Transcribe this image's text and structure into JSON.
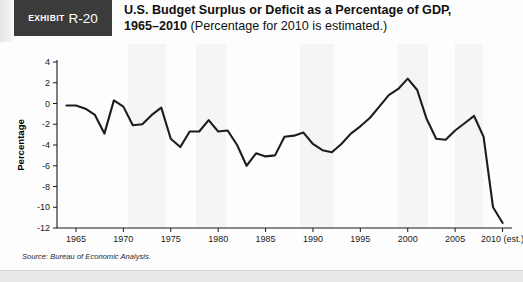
{
  "header": {
    "exhibit_word": "Exhibit",
    "exhibit_number": "R-20",
    "title_line1_bold": "U.S. Budget Surplus or Deficit as a Percentage of GDP,",
    "title_line2_bold": "1965–2010",
    "title_line2_normal": "(Percentage for 2010 is estimated.)"
  },
  "source": {
    "text": "Source: Bureau of Economic Analysis."
  },
  "chart_data": {
    "type": "line",
    "title": "U.S. Budget Surplus or Deficit as a Percentage of GDP, 1965–2010",
    "xlabel": "Year",
    "ylabel": "Percentage",
    "xlim": [
      1963,
      2011
    ],
    "ylim": [
      -12,
      4
    ],
    "ytick_values": [
      4,
      2,
      0,
      -2,
      -4,
      -6,
      -8,
      -10,
      -12
    ],
    "ytick_labels": [
      "4",
      "2",
      "0",
      "-2",
      "-4",
      "-6",
      "-8",
      "-10",
      "-12"
    ],
    "xtick_values": [
      1965,
      1970,
      1975,
      1980,
      1985,
      1990,
      1995,
      2000,
      2005,
      2010
    ],
    "xtick_labels": [
      "1965",
      "1970",
      "1975",
      "1980",
      "1985",
      "1990",
      "1995",
      "2000",
      "2005",
      "2010 (est.)"
    ],
    "grid": false,
    "legend": "none",
    "line_color": "#1d1d1d",
    "series": [
      {
        "name": "Budget surplus or deficit as % of GDP",
        "x": [
          1964,
          1965,
          1966,
          1967,
          1968,
          1969,
          1970,
          1971,
          1972,
          1973,
          1974,
          1975,
          1976,
          1977,
          1978,
          1979,
          1980,
          1981,
          1982,
          1983,
          1984,
          1985,
          1986,
          1987,
          1988,
          1989,
          1990,
          1991,
          1992,
          1993,
          1994,
          1995,
          1996,
          1997,
          1998,
          1999,
          2000,
          2001,
          2002,
          2003,
          2004,
          2005,
          2006,
          2007,
          2008,
          2009,
          2010
        ],
        "values": [
          -0.2,
          -0.2,
          -0.5,
          -1.1,
          -2.9,
          0.3,
          -0.3,
          -2.1,
          -2.0,
          -1.1,
          -0.4,
          -3.4,
          -4.2,
          -2.7,
          -2.7,
          -1.6,
          -2.7,
          -2.6,
          -4.0,
          -6.0,
          -4.8,
          -5.1,
          -5.0,
          -3.2,
          -3.1,
          -2.8,
          -3.9,
          -4.5,
          -4.7,
          -3.9,
          -2.9,
          -2.2,
          -1.4,
          -0.3,
          0.8,
          1.4,
          2.4,
          1.3,
          -1.5,
          -3.4,
          -3.5,
          -2.6,
          -1.9,
          -1.2,
          -3.2,
          -10.0,
          -11.5
        ]
      }
    ]
  }
}
